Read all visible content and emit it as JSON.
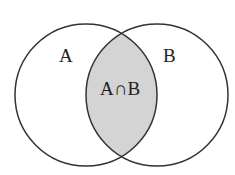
{
  "diagram": {
    "type": "venn",
    "sets": [
      {
        "label": "A",
        "cx": 86,
        "cy": 95,
        "r": 71
      },
      {
        "label": "B",
        "cx": 157,
        "cy": 95,
        "r": 71
      }
    ],
    "intersection": {
      "label": "A∩B",
      "fill": "#d4d4d4"
    },
    "stroke": "#333333"
  }
}
